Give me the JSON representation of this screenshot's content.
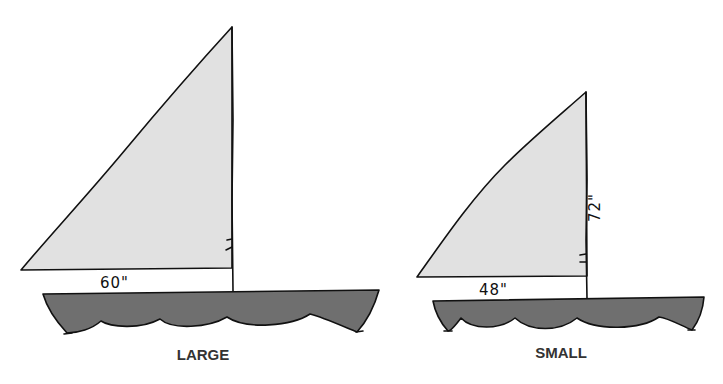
{
  "diagram": {
    "boats": [
      {
        "name": "LARGE",
        "label": "LARGE",
        "base_dimension": "60\"",
        "height_dimension": null
      },
      {
        "name": "SMALL",
        "label": "SMALL",
        "base_dimension": "48\"",
        "height_dimension": "72\""
      }
    ],
    "colors": {
      "sail": "#e1e1e1",
      "hull": "#6f6f6f",
      "outline": "#111111",
      "caption": "#333333"
    }
  }
}
